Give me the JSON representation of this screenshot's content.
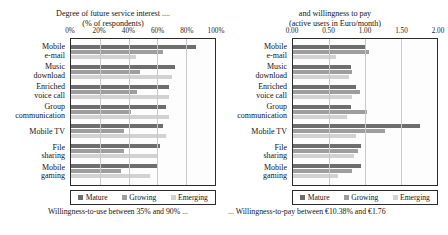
{
  "figure": {
    "legend": {
      "position": "bottom-inside-box",
      "entries": [
        "Mature",
        "Growing",
        "Emerging"
      ],
      "colors": [
        "#6e6e6e",
        "#9e9e9e",
        "#d2d2d2"
      ]
    },
    "footnotes": {
      "left": "Willingness-to-use between 35% and 90% ...",
      "right": "... Willingness-to-pay between €10.38% and €1.76"
    }
  },
  "chart_data": [
    {
      "type": "bar",
      "orientation": "horizontal",
      "panel": "left",
      "title": "Degree of future service interest ....\n(% of respondents)",
      "xlabel": "",
      "ylabel": "",
      "xlim": [
        0,
        100
      ],
      "xticks": [
        0,
        20,
        40,
        60,
        80,
        100
      ],
      "xticklabels": [
        "0%",
        "20%",
        "40%",
        "60%",
        "80%",
        "100%"
      ],
      "grid": true,
      "legend": [
        "Mature",
        "Growing",
        "Emerging"
      ],
      "categories": [
        "Mobile\ne-mail",
        "Music\ndownload",
        "Enriched\nvoice call",
        "Group\ncommunication",
        "Mobile TV",
        "File\nsharing",
        "Mobile\ngaming"
      ],
      "series": [
        {
          "name": "Mature",
          "values": [
            87,
            72,
            68,
            66,
            64,
            62,
            60
          ]
        },
        {
          "name": "Growing",
          "values": [
            64,
            48,
            46,
            42,
            37,
            37,
            35
          ]
        },
        {
          "name": "Emerging",
          "values": [
            45,
            70,
            68,
            68,
            66,
            60,
            55
          ]
        }
      ]
    },
    {
      "type": "bar",
      "orientation": "horizontal",
      "panel": "right",
      "title": "and willingness to pay\n(active users in Euro/month)",
      "xlabel": "",
      "ylabel": "",
      "xlim": [
        0,
        2
      ],
      "xticks": [
        0,
        0.5,
        1,
        1.5,
        2
      ],
      "xticklabels": [
        "0.00",
        "0.50",
        "1.00",
        "1.50",
        "2.00"
      ],
      "grid": true,
      "legend": [
        "Mature",
        "Growing",
        "Emerging"
      ],
      "categories": [
        "Mobile\ne-mail",
        "Music\ndownload",
        "Enriched\nvoice call",
        "Group\ncommunication",
        "Mobile TV",
        "File\nsharing",
        "Mobile\ngaming"
      ],
      "series": [
        {
          "name": "Mature",
          "values": [
            1.0,
            0.8,
            0.87,
            0.8,
            1.76,
            0.95,
            0.95
          ]
        },
        {
          "name": "Growing",
          "values": [
            1.05,
            0.82,
            0.93,
            1.03,
            1.28,
            0.9,
            0.82
          ]
        },
        {
          "name": "Emerging",
          "values": [
            0.6,
            0.78,
            0.82,
            0.75,
            0.87,
            0.85,
            0.62
          ]
        }
      ]
    }
  ]
}
